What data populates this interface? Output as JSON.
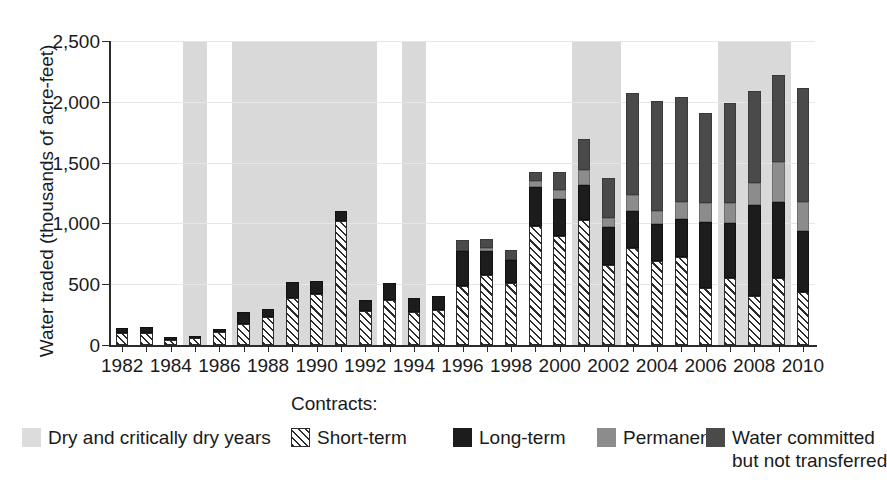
{
  "chart_data": {
    "type": "bar",
    "subtype": "stacked-bar-with-shaded-year-bands",
    "title": "",
    "xlabel": "",
    "ylabel": "Water traded (thousands of acre-feet)",
    "ylim": [
      0,
      2500
    ],
    "ytick_labels": [
      "0",
      "500",
      "1,000",
      "1,500",
      "2,000",
      "2,500"
    ],
    "ytick_values": [
      0,
      500,
      1000,
      1500,
      2000,
      2500
    ],
    "grid": true,
    "grid_axis": "y",
    "xtick_labels": [
      "1982",
      "1984",
      "1986",
      "1988",
      "1990",
      "1992",
      "1994",
      "1996",
      "1998",
      "2000",
      "2002",
      "2004",
      "2006",
      "2008",
      "2010"
    ],
    "xtick_values": [
      1982,
      1984,
      1986,
      1988,
      1990,
      1992,
      1994,
      1996,
      1998,
      2000,
      2002,
      2004,
      2006,
      2008,
      2010
    ],
    "x": [
      1982,
      1983,
      1984,
      1985,
      1986,
      1987,
      1988,
      1989,
      1990,
      1991,
      1992,
      1993,
      1994,
      1995,
      1996,
      1997,
      1998,
      1999,
      2000,
      2001,
      2002,
      2003,
      2004,
      2005,
      2006,
      2007,
      2008,
      2009,
      2010
    ],
    "categories": [
      "1982",
      "1983",
      "1984",
      "1985",
      "1986",
      "1987",
      "1988",
      "1989",
      "1990",
      "1991",
      "1992",
      "1993",
      "1994",
      "1995",
      "1996",
      "1997",
      "1998",
      "1999",
      "2000",
      "2001",
      "2002",
      "2003",
      "2004",
      "2005",
      "2006",
      "2007",
      "2008",
      "2009",
      "2010"
    ],
    "legend_position": "bottom",
    "legend_title": "Contracts:",
    "series": [
      {
        "name": "Short-term",
        "key": "short_term",
        "color": "#2b2b2b",
        "pattern": "diagonal-hatch",
        "values": [
          95,
          100,
          45,
          55,
          110,
          170,
          230,
          390,
          420,
          1020,
          280,
          370,
          275,
          290,
          485,
          575,
          510,
          980,
          900,
          1030,
          660,
          800,
          690,
          720,
          465,
          550,
          400,
          550,
          440
        ]
      },
      {
        "name": "Long-term",
        "key": "long_term",
        "color": "#1c1c1c",
        "values": [
          45,
          45,
          20,
          20,
          25,
          105,
          70,
          125,
          105,
          80,
          90,
          140,
          110,
          110,
          290,
          195,
          190,
          320,
          300,
          290,
          310,
          300,
          305,
          320,
          545,
          455,
          755,
          625,
          500
        ]
      },
      {
        "name": "Permanent",
        "key": "permanent",
        "color": "#8c8c8c",
        "values": [
          0,
          0,
          0,
          0,
          0,
          0,
          0,
          0,
          0,
          0,
          0,
          0,
          0,
          0,
          0,
          25,
          0,
          50,
          75,
          120,
          75,
          130,
          110,
          140,
          155,
          165,
          180,
          330,
          240
        ]
      },
      {
        "name": "Water committed but not transferred",
        "key": "committed_not_transferred",
        "color": "#4a4a4a",
        "values": [
          0,
          0,
          0,
          0,
          0,
          0,
          0,
          0,
          0,
          0,
          0,
          0,
          0,
          0,
          90,
          75,
          80,
          75,
          150,
          255,
          325,
          845,
          900,
          860,
          740,
          820,
          750,
          715,
          930
        ]
      }
    ],
    "totals": [
      140,
      145,
      65,
      75,
      135,
      275,
      300,
      515,
      525,
      1100,
      370,
      510,
      385,
      400,
      865,
      870,
      780,
      1425,
      1425,
      1695,
      1370,
      2075,
      2005,
      2040,
      1905,
      1990,
      2085,
      2220,
      2110
    ],
    "shaded_band_label": "Dry and critically dry years",
    "shaded_band_color": "#d9d9d9",
    "shaded_bands": [
      {
        "start": 1985,
        "end": 1985
      },
      {
        "start": 1987,
        "end": 1992
      },
      {
        "start": 1994,
        "end": 1994
      },
      {
        "start": 2001,
        "end": 2002
      },
      {
        "start": 2007,
        "end": 2009
      }
    ]
  },
  "legend": {
    "title": "Contracts:",
    "items": [
      {
        "label": "Dry and critically dry years",
        "label_line2": "",
        "swatch": "sw-dry"
      },
      {
        "label": "Short-term",
        "label_line2": "",
        "swatch": "sw-short"
      },
      {
        "label": "Long-term",
        "label_line2": "",
        "swatch": "sw-long"
      },
      {
        "label": "Permanent",
        "label_line2": "",
        "swatch": "sw-perm"
      },
      {
        "label": "Water committed",
        "label_line2": "but not transferred",
        "swatch": "sw-comm"
      }
    ]
  },
  "axes": {
    "y_title": "Water traded (thousands of acre-feet)"
  }
}
